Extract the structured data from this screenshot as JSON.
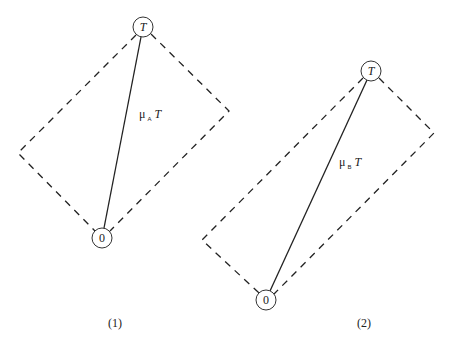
{
  "diagrams": [
    {
      "caption": "(1)",
      "top_node": {
        "label": "T",
        "cx": 143,
        "cy": 27,
        "r": 10
      },
      "bottom_node": {
        "label": "0",
        "cx": 102,
        "cy": 238,
        "r": 10
      },
      "left_vertex": {
        "x": 18,
        "y": 153
      },
      "right_vertex": {
        "x": 229,
        "y": 111
      },
      "edge_label": {
        "mu": "μ",
        "sub": "A",
        "var": "T",
        "x": 139,
        "y": 118
      }
    },
    {
      "caption": "(2)",
      "top_node": {
        "label": "T",
        "cx": 371,
        "cy": 71,
        "r": 10
      },
      "bottom_node": {
        "label": "0",
        "cx": 266,
        "cy": 300,
        "r": 10
      },
      "left_vertex": {
        "x": 202,
        "y": 240
      },
      "right_vertex": {
        "x": 434,
        "y": 133
      },
      "edge_label": {
        "mu": "μ",
        "sub": "B",
        "var": "T",
        "x": 339,
        "y": 166
      }
    }
  ],
  "captions": {
    "first": "(1)",
    "second": "(2)"
  }
}
